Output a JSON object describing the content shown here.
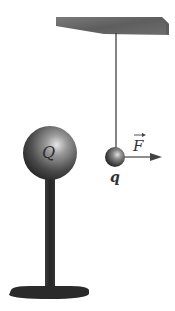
{
  "diagram": {
    "labels": {
      "source_charge": "Q",
      "test_charge": "q",
      "force": "F"
    },
    "colors": {
      "background": "#ffffff",
      "ceiling": "#6b6b6b",
      "string": "#333333",
      "sphere_dark": "#2a2a2a",
      "sphere_light": "#d8d8d8",
      "stand": "#2b2b2b",
      "arrow": "#444444",
      "label": "#333333"
    },
    "elements": [
      {
        "name": "ceiling-support",
        "shape": "slab"
      },
      {
        "name": "suspension-string",
        "shape": "line"
      },
      {
        "name": "test-charge-ball",
        "label": "q"
      },
      {
        "name": "force-arrow",
        "label": "F",
        "direction": "right"
      },
      {
        "name": "source-charge-sphere",
        "label": "Q"
      },
      {
        "name": "insulating-stand",
        "shape": "pole-with-base"
      }
    ]
  }
}
